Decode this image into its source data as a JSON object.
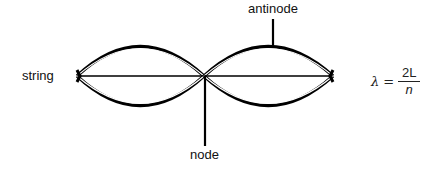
{
  "diagram": {
    "labels": {
      "string": "string",
      "antinode": "antinode",
      "node": "node"
    },
    "formula": {
      "lhs": "λ",
      "equals": "=",
      "numerator": "2L",
      "denominator": "n"
    },
    "colors": {
      "stroke": "#000000",
      "background": "#ffffff"
    }
  }
}
